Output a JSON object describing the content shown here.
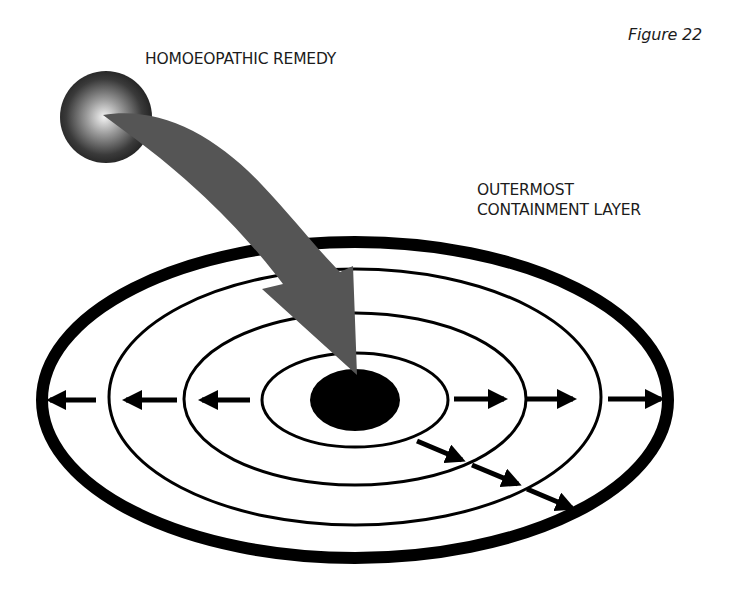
{
  "figure": {
    "caption": "Figure 22"
  },
  "labels": {
    "remedy": "HOMOEOPATHIC REMEDY",
    "outer_layer_line1": "OUTERMOST",
    "outer_layer_line2": "CONTAINMENT LAYER"
  },
  "diagram": {
    "center": [
      355,
      400
    ],
    "layers": [
      {
        "name": "core",
        "rx": 45,
        "ry": 31,
        "style": "filled"
      },
      {
        "name": "layer-1",
        "rx": 93,
        "ry": 47,
        "style": "thin"
      },
      {
        "name": "layer-2",
        "rx": 171,
        "ry": 86,
        "style": "thin"
      },
      {
        "name": "layer-3",
        "rx": 246,
        "ry": 128,
        "style": "thin"
      },
      {
        "name": "outermost-containment-layer",
        "rx": 313,
        "ry": 158,
        "style": "thick"
      }
    ],
    "arrow_directions": [
      "left",
      "right",
      "diagonal-down-right"
    ],
    "colors": {
      "ink": "#000000",
      "remedy_arrow": "#555555",
      "sphere_dark": "#1e1e1e",
      "sphere_light": "#f4f4f4",
      "background": "#ffffff"
    }
  }
}
